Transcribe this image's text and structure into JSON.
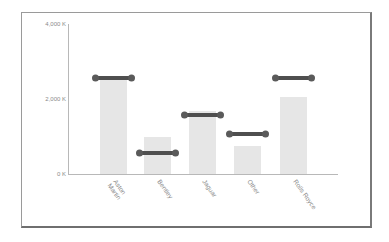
{
  "chart_data": {
    "type": "bar",
    "title": "",
    "xlabel": "",
    "ylabel": "",
    "ylim": [
      0,
      4000
    ],
    "y_unit": "K",
    "y_ticks": [
      "0 K",
      "2,000 K",
      "4,000 K"
    ],
    "categories": [
      "Aston Martin",
      "Bentley",
      "Jaguar",
      "Other",
      "Rolls Royce"
    ],
    "series": [
      {
        "name": "Bar value",
        "type": "bar",
        "values": [
          2500,
          1000,
          1680,
          760,
          2050
        ]
      },
      {
        "name": "Target marker",
        "type": "marker",
        "values": [
          2560,
          560,
          1570,
          1070,
          2560
        ]
      }
    ],
    "grid": false,
    "legend": "none"
  },
  "axis": {
    "y_ticks": [
      {
        "label": "4,000 K",
        "value": 4000
      },
      {
        "label": "2,000 K",
        "value": 2000
      },
      {
        "label": "0 K",
        "value": 0
      }
    ]
  },
  "categories": [
    {
      "label": "Aston\nMartin"
    },
    {
      "label": "Bentley"
    },
    {
      "label": "Jaguar"
    },
    {
      "label": "Other"
    },
    {
      "label": "Rolls Royce"
    }
  ],
  "colors": {
    "bar": "#e6e6e6",
    "marker": "#4f4f4f",
    "axis": "#b8b8b8",
    "frame": "#7a7a7a"
  }
}
